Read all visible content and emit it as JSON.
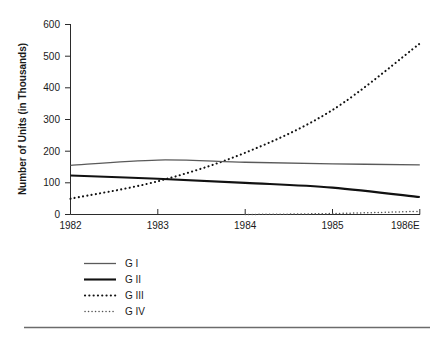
{
  "chart_data": {
    "type": "line",
    "title": "",
    "xlabel": "",
    "ylabel": "Number of Units (in Thousands)",
    "x": [
      "1982",
      "1983",
      "1984",
      "1985",
      "1986E"
    ],
    "xtick_labels": [
      "1982",
      "1983",
      "1984",
      "1985",
      "1986E"
    ],
    "ytick_labels": [
      "0",
      "100",
      "200",
      "300",
      "400",
      "500",
      "600"
    ],
    "ytick_values": [
      0,
      100,
      200,
      300,
      400,
      500,
      600
    ],
    "ylim": [
      0,
      600
    ],
    "xlim": [
      1982,
      1986
    ],
    "grid": false,
    "legend_position": "below-left",
    "series": [
      {
        "name": "G I",
        "style": "solid-thin",
        "color": "#5a5a5a",
        "values": [
          155,
          172,
          165,
          160,
          157
        ]
      },
      {
        "name": "G II",
        "style": "solid-thick",
        "color": "#111111",
        "values": [
          123,
          113,
          100,
          85,
          55
        ]
      },
      {
        "name": "G III",
        "style": "dotted-large",
        "color": "#111111",
        "values": [
          50,
          105,
          195,
          330,
          540
        ]
      },
      {
        "name": "G IV",
        "style": "dotted-small",
        "color": "#555555",
        "values": [
          null,
          null,
          0,
          3,
          10
        ]
      }
    ]
  },
  "legend": {
    "items": [
      {
        "label": "G I"
      },
      {
        "label": "G II"
      },
      {
        "label": "G III"
      },
      {
        "label": "G IV"
      }
    ]
  },
  "axis": {
    "y_title": "Number of Units (in Thousands)",
    "y_ticks": [
      "600",
      "500",
      "400",
      "300",
      "200",
      "100",
      "0"
    ],
    "x_ticks": [
      "1982",
      "1983",
      "1984",
      "1985",
      "1986E"
    ]
  },
  "colors": {
    "axis": "#2b2b2b",
    "text": "#1a1a1a",
    "g1": "#5a5a5a",
    "g2": "#111111",
    "g3": "#111111",
    "g4": "#555555",
    "rule": "#6b6b6b"
  }
}
